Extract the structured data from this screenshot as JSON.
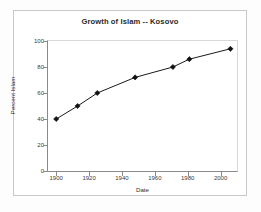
{
  "chart_data": {
    "type": "line",
    "title": "Growth of Islam -- Kosovo",
    "xlabel": "Date",
    "ylabel": "Percent Islam",
    "xlim": [
      1895,
      2010
    ],
    "ylim": [
      0,
      100
    ],
    "grid": false,
    "legend": "none",
    "marker": "diamond",
    "line_color": "#1a1a1a",
    "marker_color": "#111111",
    "x_ticks": [
      1900,
      1920,
      1940,
      1960,
      1980,
      2000
    ],
    "x_tick_labels": [
      "1900",
      "1920",
      "1940",
      "1960",
      "1980",
      "2000"
    ],
    "y_ticks": [
      0,
      20,
      40,
      60,
      80,
      100
    ],
    "y_tick_labels": [
      "0",
      "20",
      "40",
      "60",
      "80",
      "100"
    ],
    "x": [
      1900,
      1913,
      1925,
      1948,
      1971,
      1981,
      2006
    ],
    "values": [
      40,
      50,
      60,
      72,
      80,
      86,
      94
    ],
    "points": [
      {
        "x": 1900,
        "y": 40
      },
      {
        "x": 1913,
        "y": 50
      },
      {
        "x": 1925,
        "y": 60
      },
      {
        "x": 1948,
        "y": 72
      },
      {
        "x": 1971,
        "y": 80
      },
      {
        "x": 1981,
        "y": 86
      },
      {
        "x": 2006,
        "y": 94
      }
    ]
  },
  "figure": {
    "background_color": "#ffffff",
    "border_color": "#c8c8c8",
    "axis_color": "#8a8a8a"
  }
}
